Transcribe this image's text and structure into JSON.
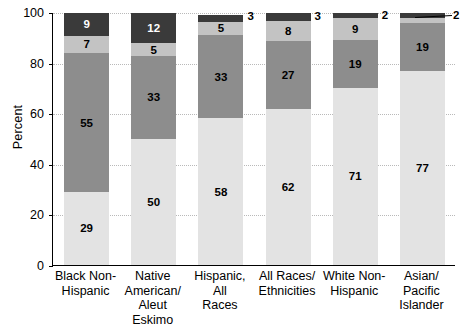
{
  "chart_data": {
    "type": "bar",
    "subtype": "stacked-bar-100",
    "title": "",
    "xlabel": "",
    "ylabel": "Percent",
    "ylim": [
      0,
      100
    ],
    "yticks": [
      0,
      20,
      40,
      60,
      80,
      100
    ],
    "grid": true,
    "legend": "none",
    "categories": [
      "Black Non-Hispanic",
      "Native American/ Aleut Eskimo",
      "Hispanic, All Races",
      "All Races/ Ethnicities",
      "White Non-Hispanic",
      "Asian/ Pacific Islander"
    ],
    "category_lines": [
      [
        "Black Non-",
        "Hispanic"
      ],
      [
        "Native",
        "American/",
        "Aleut",
        "Eskimo"
      ],
      [
        "Hispanic,",
        "All",
        "Races"
      ],
      [
        "All Races/",
        "Ethnicities"
      ],
      [
        "White Non-",
        "Hispanic"
      ],
      [
        "Asian/",
        "Pacific",
        "Islander"
      ]
    ],
    "series": [
      {
        "name": "segment-1",
        "color": "#e3e3e3",
        "values": [
          29,
          50,
          58,
          62,
          71,
          77
        ]
      },
      {
        "name": "segment-2",
        "color": "#8d8d8d",
        "values": [
          55,
          33,
          33,
          27,
          19,
          19
        ]
      },
      {
        "name": "segment-3",
        "color": "#c3c3c3",
        "values": [
          7,
          5,
          5,
          8,
          9,
          2
        ]
      },
      {
        "name": "segment-4",
        "color": "#3a3a3a",
        "values": [
          9,
          12,
          3,
          3,
          2,
          2
        ]
      }
    ],
    "callouts": [
      {
        "category": "White Non-Hispanic",
        "series": "segment-4",
        "value": "2"
      },
      {
        "category": "Asian/ Pacific Islander",
        "series": "segment-4",
        "value": "2"
      }
    ]
  },
  "axis": {
    "y_title": "Percent",
    "y_tick_labels": [
      "0",
      "20",
      "40",
      "60",
      "80",
      "100"
    ]
  }
}
